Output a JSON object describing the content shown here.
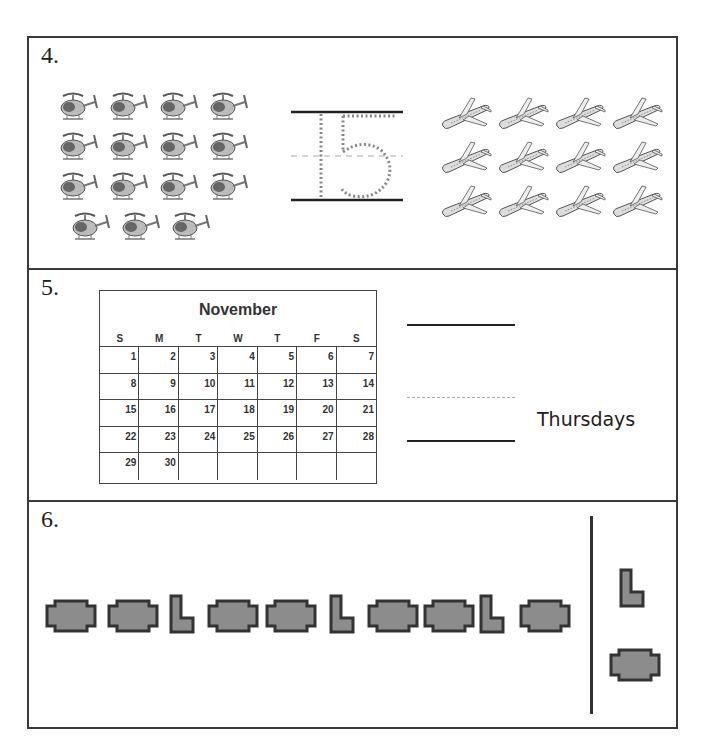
{
  "problems": [
    {
      "number": "4.",
      "left_group": {
        "icon": "helicopter-icon",
        "count": 15,
        "rows": [
          4,
          4,
          4,
          3
        ]
      },
      "trace_number": "15",
      "right_group": {
        "icon": "airplane-icon",
        "count": 12,
        "rows": [
          4,
          4,
          4
        ]
      }
    },
    {
      "number": "5.",
      "calendar": {
        "month": "November",
        "weekdays": [
          "S",
          "M",
          "T",
          "W",
          "T",
          "F",
          "S"
        ],
        "days": [
          "1",
          "2",
          "3",
          "4",
          "5",
          "6",
          "7",
          "8",
          "9",
          "10",
          "11",
          "12",
          "13",
          "14",
          "15",
          "16",
          "17",
          "18",
          "19",
          "20",
          "21",
          "22",
          "23",
          "24",
          "25",
          "26",
          "27",
          "28",
          "29",
          "30",
          "",
          "",
          "",
          "",
          ""
        ]
      },
      "answer_label": "Thursdays"
    },
    {
      "number": "6.",
      "pattern": [
        "octagon",
        "octagon",
        "L",
        "octagon",
        "octagon",
        "L",
        "octagon",
        "octagon",
        "L",
        "octagon"
      ],
      "choices": [
        "L",
        "octagon"
      ]
    }
  ],
  "colors": {
    "border": "#3a3a3a",
    "shape_fill": "#8c8c8c",
    "shape_stroke": "#333333"
  }
}
